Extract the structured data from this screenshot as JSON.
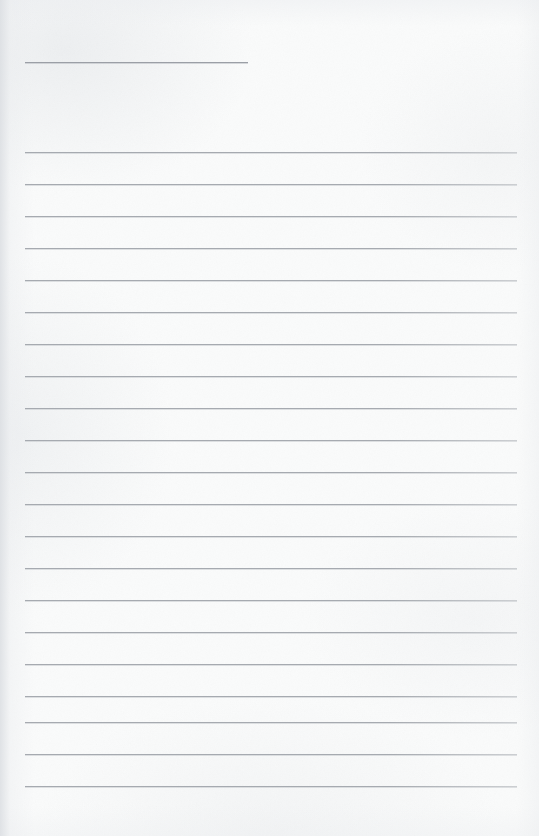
{
  "document": {
    "type": "ruled-paper-scan",
    "title": "Blank Lined Notebook Page",
    "description": "Scanned sheet of ruled writing paper with no handwriting or printed text",
    "width_px": 539,
    "height_px": 836,
    "background_color": "#fafbfb",
    "rule_color": "#a6aab0",
    "has_text": false,
    "text_content": ""
  },
  "layout": {
    "left_margin_px": 25,
    "right_edge_px": 517,
    "line_spacing_px": 32,
    "first_long_rule_y_px": 152,
    "last_long_rule_y_px": 786,
    "long_rule_count": 21
  },
  "header_rule": {
    "name": "header-rule",
    "y_px": 62,
    "x_start_px": 25,
    "x_end_px": 248,
    "length_px": 223,
    "purpose": "short rule for date or title entry"
  },
  "rules": [
    {
      "index": 1,
      "y_px": 152,
      "x_start_px": 25,
      "x_end_px": 517
    },
    {
      "index": 2,
      "y_px": 184,
      "x_start_px": 25,
      "x_end_px": 517
    },
    {
      "index": 3,
      "y_px": 216,
      "x_start_px": 25,
      "x_end_px": 517
    },
    {
      "index": 4,
      "y_px": 248,
      "x_start_px": 25,
      "x_end_px": 517
    },
    {
      "index": 5,
      "y_px": 280,
      "x_start_px": 25,
      "x_end_px": 517
    },
    {
      "index": 6,
      "y_px": 312,
      "x_start_px": 25,
      "x_end_px": 517
    },
    {
      "index": 7,
      "y_px": 344,
      "x_start_px": 25,
      "x_end_px": 517
    },
    {
      "index": 8,
      "y_px": 376,
      "x_start_px": 25,
      "x_end_px": 517
    },
    {
      "index": 9,
      "y_px": 408,
      "x_start_px": 25,
      "x_end_px": 517
    },
    {
      "index": 10,
      "y_px": 440,
      "x_start_px": 25,
      "x_end_px": 517
    },
    {
      "index": 11,
      "y_px": 472,
      "x_start_px": 25,
      "x_end_px": 517
    },
    {
      "index": 12,
      "y_px": 504,
      "x_start_px": 25,
      "x_end_px": 517
    },
    {
      "index": 13,
      "y_px": 536,
      "x_start_px": 25,
      "x_end_px": 517
    },
    {
      "index": 14,
      "y_px": 568,
      "x_start_px": 25,
      "x_end_px": 517
    },
    {
      "index": 15,
      "y_px": 600,
      "x_start_px": 25,
      "x_end_px": 517
    },
    {
      "index": 16,
      "y_px": 632,
      "x_start_px": 25,
      "x_end_px": 517
    },
    {
      "index": 17,
      "y_px": 664,
      "x_start_px": 25,
      "x_end_px": 517
    },
    {
      "index": 18,
      "y_px": 696,
      "x_start_px": 25,
      "x_end_px": 517
    },
    {
      "index": 19,
      "y_px": 722,
      "x_start_px": 25,
      "x_end_px": 517
    },
    {
      "index": 20,
      "y_px": 754,
      "x_start_px": 25,
      "x_end_px": 517
    },
    {
      "index": 21,
      "y_px": 786,
      "x_start_px": 25,
      "x_end_px": 517
    }
  ]
}
